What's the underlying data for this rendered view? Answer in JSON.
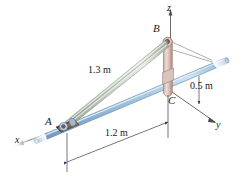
{
  "figure": {
    "type": "engineering-statics-diagram",
    "points": [
      {
        "id": "A",
        "label": "A"
      },
      {
        "id": "B",
        "label": "B"
      },
      {
        "id": "C",
        "label": "C"
      }
    ],
    "dimensions": [
      {
        "id": "strut-length",
        "label": "1.3 m",
        "value": 1.3,
        "unit": "m"
      },
      {
        "id": "base-length",
        "label": "1.2 m",
        "value": 1.2,
        "unit": "m"
      },
      {
        "id": "offset-length",
        "label": "0.5 m",
        "value": 0.5,
        "unit": "m"
      }
    ],
    "axes": [
      {
        "id": "x",
        "label": "x"
      },
      {
        "id": "y",
        "label": "y"
      },
      {
        "id": "z",
        "label": "z"
      }
    ],
    "colors": {
      "rod_blue": "#9fc0dd",
      "rod_blue_light": "#cfe0ef",
      "rod_blue_dark": "#5d87ae",
      "strut_gray": "#c9d2c8",
      "strut_gray_light": "#e6ece4",
      "strut_gray_dark": "#8e9a8d",
      "post_pink": "#e3c7c0",
      "post_pink_light": "#f2e2dd",
      "post_pink_dark": "#b3938c",
      "collar_brown": "#8a6a52",
      "line_gray": "#8a8a8a",
      "dim_line": "#4a4a6a",
      "text": "#1a1a1a"
    }
  }
}
